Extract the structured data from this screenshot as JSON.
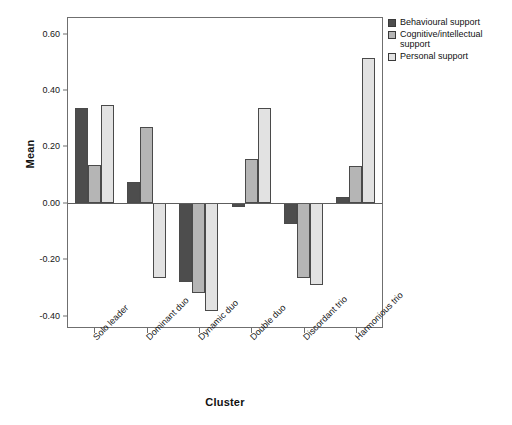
{
  "chart_data": {
    "type": "bar",
    "title": "",
    "subtitle": "",
    "xlabel": "Cluster",
    "ylabel": "Mean",
    "categories": [
      "Solo leader",
      "Dominant duo",
      "Dynamic duo",
      "Double duo",
      "Discordant trio",
      "Harmonious trio"
    ],
    "series": [
      {
        "name": "Behavioural support",
        "color": "#4d4d4d",
        "values": [
          0.335,
          0.075,
          -0.28,
          -0.015,
          -0.075,
          0.02
        ]
      },
      {
        "name": "Cognitive/intellectual support",
        "color": "#b5b5b5",
        "values": [
          0.135,
          0.27,
          -0.32,
          0.155,
          -0.265,
          0.13
        ]
      },
      {
        "name": "Personal support",
        "color": "#e2e2e2",
        "values": [
          0.348,
          -0.265,
          -0.385,
          0.335,
          -0.29,
          0.515
        ]
      }
    ],
    "ylim": [
      -0.44,
      0.655
    ],
    "yticks": [
      0.6,
      0.4,
      0.2,
      0.0,
      -0.2,
      -0.4
    ],
    "ytick_labels": [
      "0.60",
      "0.40",
      "0.20",
      "0.00",
      "-0.20",
      "-0.40"
    ],
    "grid": false,
    "legend_position": "top-right",
    "legend_entries": [
      "Behavioural support",
      "Cognitive/intellectual support",
      "Personal support"
    ]
  }
}
